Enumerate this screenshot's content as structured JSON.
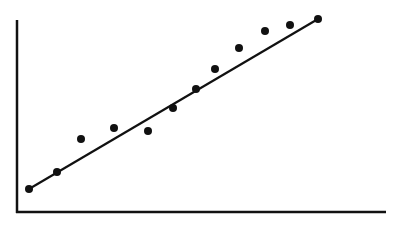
{
  "chart_data": {
    "type": "scatter",
    "title": "",
    "xlabel": "",
    "ylabel": "",
    "grid": false,
    "legend": null,
    "x": [
      1,
      2,
      3,
      4,
      5,
      6,
      7,
      8,
      9,
      10,
      11,
      12
    ],
    "y": [
      1.2,
      2.1,
      3.8,
      4.4,
      4.3,
      5.5,
      6.5,
      7.5,
      8.6,
      9.4,
      9.7,
      10.0
    ],
    "trendline": {
      "type": "linear",
      "from": [
        1,
        1.2
      ],
      "to": [
        12,
        10.0
      ]
    },
    "marker_color": "#111111",
    "line_color": "#111111",
    "pixel_points": [
      [
        29,
        189
      ],
      [
        57,
        172
      ],
      [
        81,
        139
      ],
      [
        114,
        128
      ],
      [
        148,
        131
      ],
      [
        173,
        108
      ],
      [
        196,
        89
      ],
      [
        215,
        69
      ],
      [
        239,
        48
      ],
      [
        265,
        31
      ],
      [
        290,
        25
      ],
      [
        318,
        19
      ]
    ],
    "axes": {
      "origin": [
        17,
        212
      ],
      "y_top": 20,
      "x_right": 386
    }
  }
}
